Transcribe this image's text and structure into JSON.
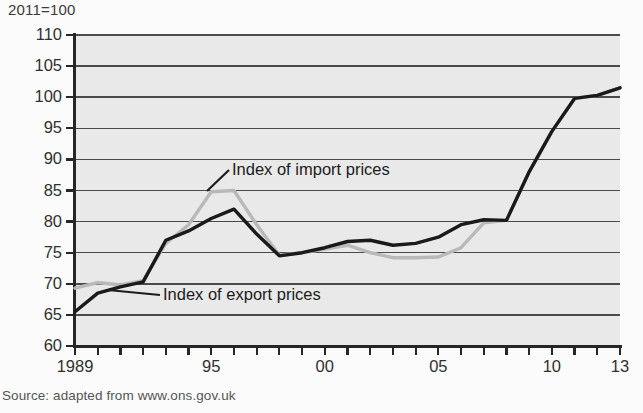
{
  "unit_note": "2011=100",
  "source": "Source: adapted from www.ons.gov.uk",
  "annotations": {
    "import_label": "Index of import prices",
    "export_label": "Index of export prices"
  },
  "colors": {
    "plot_background": "#e9e9e9",
    "gridline": "#4a4a4a",
    "axis": "#262626",
    "export_line": "#1a1a1a",
    "import_line": "#b9b9b9",
    "text": "#303030"
  },
  "chart_data": {
    "type": "line",
    "title": "",
    "subtitle": "",
    "xlabel": "",
    "ylabel": "2011=100",
    "xlim": [
      1989,
      2013
    ],
    "ylim": [
      60,
      110
    ],
    "ytick_labels": [
      "110",
      "105",
      "100",
      "95",
      "90",
      "85",
      "80",
      "75",
      "70",
      "65",
      "60"
    ],
    "ytick_values": [
      110,
      105,
      100,
      95,
      90,
      85,
      80,
      75,
      70,
      65,
      60
    ],
    "xtick_values": [
      1989,
      1990,
      1991,
      1992,
      1993,
      1994,
      1995,
      1996,
      1997,
      1998,
      1999,
      2000,
      2001,
      2002,
      2003,
      2004,
      2005,
      2006,
      2007,
      2008,
      2009,
      2010,
      2011,
      2012,
      2013
    ],
    "xtick_labels": [
      {
        "value": 1989,
        "label": "1989"
      },
      {
        "value": 1995,
        "label": "95"
      },
      {
        "value": 2000,
        "label": "00"
      },
      {
        "value": 2005,
        "label": "05"
      },
      {
        "value": 2010,
        "label": "10"
      },
      {
        "value": 2013,
        "label": "13"
      }
    ],
    "grid": true,
    "legend": "annotations-on-plot",
    "x": [
      1989,
      1990,
      1991,
      1992,
      1993,
      1994,
      1995,
      1996,
      1997,
      1998,
      1999,
      2000,
      2001,
      2002,
      2003,
      2004,
      2005,
      2006,
      2007,
      2008,
      2009,
      2010,
      2011,
      2012,
      2013
    ],
    "series": [
      {
        "name": "Index of export prices",
        "color": "#1a1a1a",
        "values": [
          65.5,
          68.5,
          69.5,
          70.3,
          77.0,
          78.5,
          80.5,
          82.0,
          78.0,
          74.5,
          75.0,
          75.8,
          76.8,
          77.0,
          76.2,
          76.5,
          77.5,
          79.5,
          80.3,
          80.2,
          88.0,
          94.5,
          99.8,
          100.3,
          101.5
        ]
      },
      {
        "name": "Index of import prices",
        "color": "#b9b9b9",
        "values": [
          69.3,
          70.2,
          69.8,
          70.5,
          76.5,
          79.5,
          84.8,
          85.0,
          79.5,
          74.6,
          75.0,
          75.6,
          76.2,
          75.0,
          74.2,
          74.2,
          74.3,
          75.8,
          79.8,
          80.2,
          88.0,
          94.5,
          99.8,
          100.3,
          101.5
        ]
      }
    ]
  }
}
